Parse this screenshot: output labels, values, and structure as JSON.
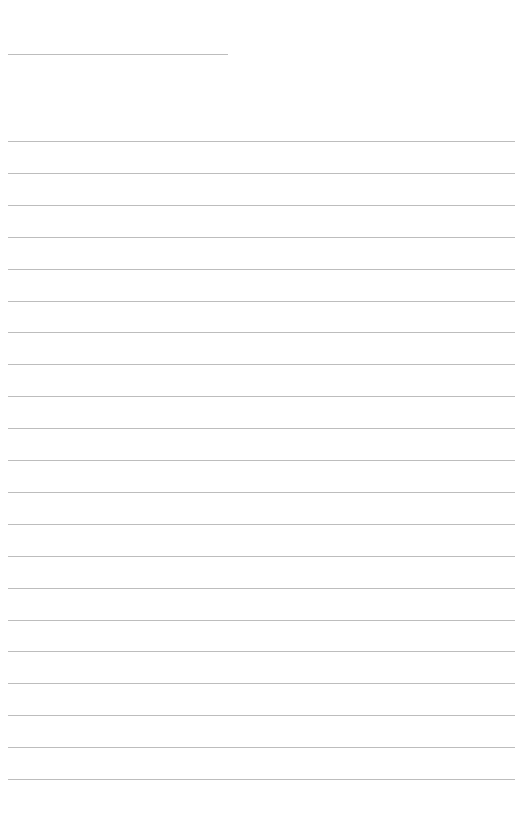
{
  "page": {
    "type": "ruled-sheet",
    "background_color": "#ffffff",
    "line_color": "#bdbdbd",
    "header_rule": {
      "x": 8,
      "y": 54,
      "width": 220
    },
    "ruled_lines": {
      "count": 21,
      "first_y": 141,
      "spacing": 31.9,
      "x": 8,
      "width": 507
    }
  }
}
